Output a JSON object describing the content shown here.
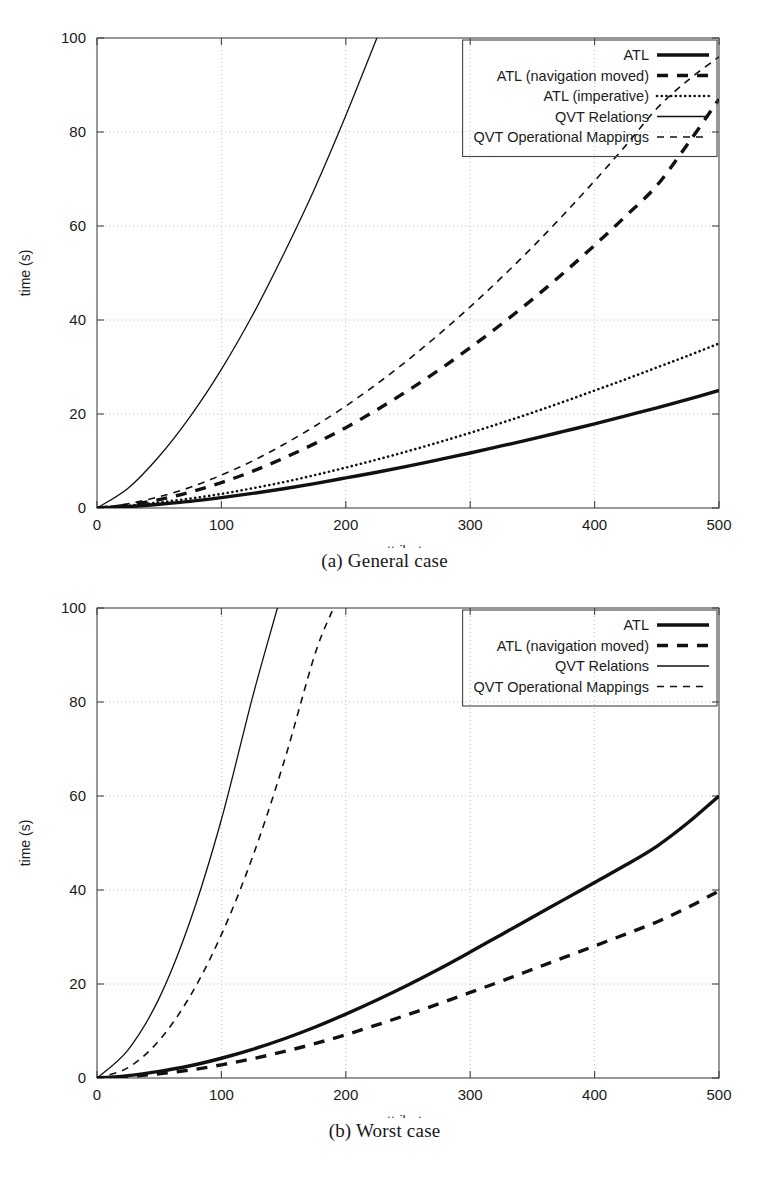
{
  "document": {
    "kind": "two-panel-figure",
    "panels": [
      "a",
      "b"
    ]
  },
  "figures": [
    {
      "id": "a",
      "caption": "(a) General case"
    },
    {
      "id": "b",
      "caption": "(b) Worst case"
    }
  ],
  "chart_data": [
    {
      "type": "line",
      "panel": "a",
      "title": "(a) General case",
      "xlabel": "attributes",
      "ylabel": "time (s)",
      "xlim": [
        0,
        500
      ],
      "ylim": [
        0,
        100
      ],
      "xticks": [
        0,
        100,
        200,
        300,
        400,
        500
      ],
      "yticks": [
        0,
        20,
        40,
        60,
        80,
        100
      ],
      "xtick_labels": [
        "0",
        "100",
        "200",
        "300",
        "400",
        "500"
      ],
      "ytick_labels": [
        "0",
        "20",
        "40",
        "60",
        "80",
        "100"
      ],
      "grid": true,
      "legend_position": "top-right",
      "x": [
        0,
        25,
        50,
        75,
        100,
        125,
        150,
        175,
        200,
        225,
        250,
        275,
        300,
        325,
        350,
        375,
        400,
        425,
        450,
        475,
        500
      ],
      "series": [
        {
          "name": "ATL",
          "style": "thick-solid",
          "color": "#111111",
          "values": [
            0,
            0.3,
            0.8,
            1.4,
            2.2,
            3.1,
            4.1,
            5.2,
            6.4,
            7.6,
            8.9,
            10.3,
            11.7,
            13.2,
            14.7,
            16.3,
            17.9,
            19.6,
            21.3,
            23.1,
            25.0
          ]
        },
        {
          "name": "ATL (navigation moved)",
          "style": "thick-dashed",
          "color": "#111111",
          "values": [
            0,
            0.6,
            1.8,
            3.4,
            5.4,
            7.8,
            10.6,
            13.7,
            17.1,
            20.9,
            25.0,
            29.4,
            34.1,
            39.1,
            44.4,
            50.0,
            55.9,
            62.1,
            68.6,
            77.5,
            87.0
          ]
        },
        {
          "name": "ATL (imperative)",
          "style": "dotted",
          "color": "#111111",
          "values": [
            0,
            0.5,
            1.2,
            2.0,
            3.0,
            4.2,
            5.5,
            7.0,
            8.6,
            10.3,
            12.1,
            14.0,
            16.0,
            18.1,
            20.3,
            22.6,
            25.0,
            27.4,
            29.9,
            32.4,
            35.0
          ]
        },
        {
          "name": "QVT Relations",
          "style": "thin-solid",
          "color": "#111111",
          "values": [
            0,
            4.2,
            11.0,
            19.5,
            29.5,
            41.0,
            54.0,
            68.0,
            83.5,
            100.0
          ],
          "x": [
            0,
            25,
            50,
            75,
            100,
            125,
            150,
            175,
            200,
            225
          ],
          "clipped_at_y": 100,
          "note": "exceeds plot top near x = 120"
        },
        {
          "name": "QVT Operational Mappings",
          "style": "thin-dashed",
          "color": "#111111",
          "values": [
            0,
            0.9,
            2.4,
            4.4,
            7.0,
            10.0,
            13.5,
            17.4,
            21.7,
            26.4,
            31.5,
            37.0,
            42.8,
            49.0,
            55.5,
            62.4,
            69.6,
            77.1,
            85.0,
            91.0,
            96.0
          ]
        }
      ],
      "legend": [
        {
          "label": "ATL",
          "style": "thick-solid"
        },
        {
          "label": "ATL (navigation moved)",
          "style": "thick-dashed"
        },
        {
          "label": "ATL (imperative)",
          "style": "dotted"
        },
        {
          "label": "QVT Relations",
          "style": "thin-solid"
        },
        {
          "label": "QVT Operational Mappings",
          "style": "thin-dashed"
        }
      ]
    },
    {
      "type": "line",
      "panel": "b",
      "title": "(b) Worst case",
      "xlabel": "attributes",
      "ylabel": "time (s)",
      "xlim": [
        0,
        500
      ],
      "ylim": [
        0,
        100
      ],
      "xticks": [
        0,
        100,
        200,
        300,
        400,
        500
      ],
      "yticks": [
        0,
        20,
        40,
        60,
        80,
        100
      ],
      "xtick_labels": [
        "0",
        "100",
        "200",
        "300",
        "400",
        "500"
      ],
      "ytick_labels": [
        "0",
        "20",
        "40",
        "60",
        "80",
        "100"
      ],
      "grid": true,
      "legend_position": "top-right",
      "x": [
        0,
        25,
        50,
        75,
        100,
        125,
        150,
        175,
        200,
        225,
        250,
        275,
        300,
        325,
        350,
        375,
        400,
        425,
        450,
        475,
        500
      ],
      "series": [
        {
          "name": "ATL",
          "style": "thick-solid",
          "color": "#111111",
          "values": [
            0,
            0.5,
            1.4,
            2.6,
            4.2,
            6.1,
            8.3,
            10.8,
            13.6,
            16.6,
            19.8,
            23.2,
            26.8,
            30.5,
            34.2,
            37.9,
            41.6,
            45.3,
            49.3,
            54.3,
            60.0
          ]
        },
        {
          "name": "ATL (navigation moved)",
          "style": "thick-dashed",
          "color": "#111111",
          "values": [
            0,
            0.3,
            0.9,
            1.7,
            2.8,
            4.1,
            5.6,
            7.3,
            9.2,
            11.3,
            13.5,
            15.8,
            18.2,
            20.6,
            23.1,
            25.6,
            28.1,
            30.6,
            33.2,
            36.3,
            39.8
          ]
        },
        {
          "name": "QVT Relations",
          "style": "thin-solid",
          "color": "#111111",
          "values": [
            0,
            6.0,
            17.0,
            33.5,
            55.0,
            81.0,
            100.0
          ],
          "x": [
            0,
            25,
            50,
            75,
            100,
            125,
            145
          ],
          "clipped_at_y": 100,
          "note": "exceeds plot top near x = 103"
        },
        {
          "name": "QVT Operational Mappings",
          "style": "thin-dashed",
          "color": "#111111",
          "values": [
            0,
            2.2,
            8.0,
            17.5,
            30.5,
            47.0,
            67.0,
            90.0,
            100.0
          ],
          "x": [
            0,
            25,
            50,
            75,
            100,
            125,
            150,
            175,
            190
          ],
          "clipped_at_y": 100,
          "note": "exceeds plot top near x = 148"
        }
      ],
      "legend": [
        {
          "label": "ATL",
          "style": "thick-solid"
        },
        {
          "label": "ATL (navigation moved)",
          "style": "thick-dashed"
        },
        {
          "label": "QVT Relations",
          "style": "thin-solid"
        },
        {
          "label": "QVT Operational Mappings",
          "style": "thin-dashed"
        }
      ]
    }
  ]
}
